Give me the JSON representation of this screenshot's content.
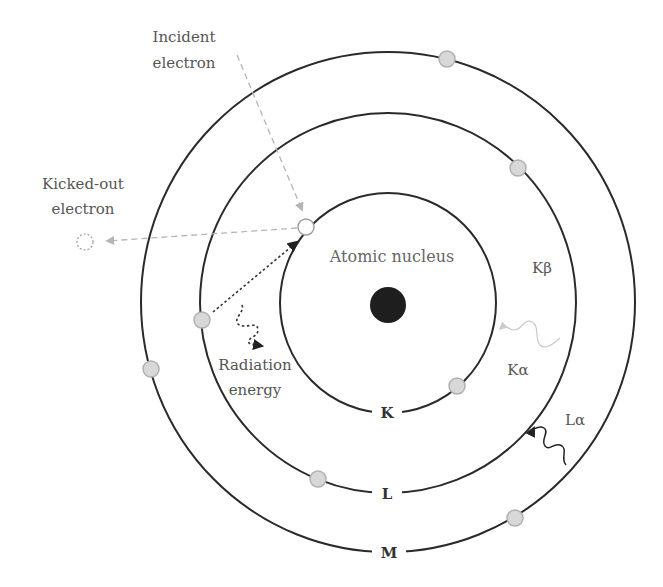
{
  "diagram": {
    "type": "bohr-atom-xray-emission",
    "center": {
      "x": 388,
      "y": 303
    },
    "colors": {
      "orbit": "#2a2a2a",
      "nucleus": "#1e1e1e",
      "electron_fill": "#d8d8d8",
      "electron_stroke": "#b0b0b0",
      "incident_arrow": "#b5b5b5",
      "radiation_arrow": "#333333",
      "k_alpha_wave": "#c8c8c8",
      "text": "#555555"
    },
    "nucleus": {
      "label": "Atomic nucleus",
      "x": 388,
      "y": 305,
      "r": 18
    },
    "shells": [
      {
        "name": "K",
        "label": "K",
        "rx": 108,
        "ry": 110,
        "label_y": 413
      },
      {
        "name": "L",
        "label": "L",
        "rx": 188,
        "ry": 190,
        "label_y": 494
      },
      {
        "name": "M",
        "label": "M",
        "rx": 247,
        "ry": 250,
        "label_y": 553
      }
    ],
    "electrons": [
      {
        "shell": "K",
        "x": 306,
        "y": 227,
        "state": "vacancy"
      },
      {
        "shell": "K",
        "x": 457,
        "y": 386,
        "state": "filled"
      },
      {
        "shell": "L",
        "x": 202,
        "y": 320,
        "state": "filled"
      },
      {
        "shell": "L",
        "x": 518,
        "y": 168,
        "state": "filled"
      },
      {
        "shell": "L",
        "x": 318,
        "y": 479,
        "state": "filled"
      },
      {
        "shell": "M",
        "x": 447,
        "y": 59,
        "state": "filled"
      },
      {
        "shell": "M",
        "x": 151,
        "y": 369,
        "state": "filled"
      },
      {
        "shell": "M",
        "x": 515,
        "y": 518,
        "state": "filled"
      }
    ],
    "labels": {
      "incident_line1": "Incident",
      "incident_line2": "electron",
      "kicked_line1": "Kicked-out",
      "kicked_line2": "electron",
      "radiation_line1": "Radiation",
      "radiation_line2": "energy",
      "k_beta": "Kβ",
      "k_alpha": "Kα",
      "l_alpha": "Lα"
    },
    "arrows": [
      {
        "name": "incident-electron-arrow",
        "style": "dashed",
        "from": [
          237,
          55
        ],
        "to": [
          302,
          210
        ]
      },
      {
        "name": "kicked-out-arrow",
        "style": "dashed",
        "from": [
          297,
          227
        ],
        "to": [
          105,
          241
        ]
      },
      {
        "name": "l-to-k-transition-arrow",
        "style": "dotted",
        "from": [
          212,
          313
        ],
        "to": [
          300,
          240
        ]
      },
      {
        "name": "radiation-energy-wave",
        "style": "dotted-wave"
      },
      {
        "name": "k-alpha-wave",
        "style": "light-wave"
      },
      {
        "name": "l-alpha-wave",
        "style": "solid-wave"
      }
    ]
  }
}
